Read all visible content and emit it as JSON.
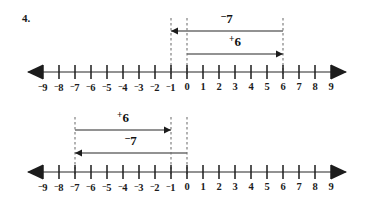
{
  "page": {
    "problem_number": "4.",
    "background_color": "#ffffff",
    "ink_color": "#1c1c1c",
    "line_color": "#6e6e6e",
    "dash_color": "#8a8a8a"
  },
  "axis": {
    "min": -9,
    "max": 9,
    "step": 1,
    "tick_labels": [
      "⁻9",
      "⁻8",
      "⁻7",
      "⁻6",
      "⁻5",
      "⁻4",
      "⁻3",
      "⁻2",
      "⁻1",
      "0",
      "1",
      "2",
      "3",
      "4",
      "5",
      "6",
      "7",
      "8",
      "9"
    ],
    "left_arrowhead": "arrow-left-icon",
    "right_arrowhead": "arrow-right-icon"
  },
  "chart_data": {
    "type": "line",
    "xlabel": "",
    "ylabel": "",
    "xlim": [
      -9,
      9
    ],
    "grid": false,
    "legend": "none",
    "x": [
      -9,
      -8,
      -7,
      -6,
      -5,
      -4,
      -3,
      -2,
      -1,
      0,
      1,
      2,
      3,
      4,
      5,
      6,
      7,
      8,
      9
    ],
    "diagrams": [
      {
        "id": "diagram-1",
        "order": "⁻7 first, then ⁺6",
        "dashed_guides": [
          -1,
          0,
          6
        ],
        "jumps": [
          {
            "id": "jump-1-1",
            "label": "⁻7",
            "label_sign": "⁻",
            "label_value": "7",
            "start": 6,
            "end": -1,
            "direction": "left",
            "row": "upper"
          },
          {
            "id": "jump-1-2",
            "label": "⁺6",
            "label_sign": "⁺",
            "label_value": "6",
            "start": 0,
            "end": 6,
            "direction": "right",
            "row": "lower"
          }
        ]
      },
      {
        "id": "diagram-2",
        "order": "⁺6 first, then ⁻7",
        "dashed_guides": [
          -7,
          -1,
          0
        ],
        "jumps": [
          {
            "id": "jump-2-1",
            "label": "⁺6",
            "label_sign": "⁺",
            "label_value": "6",
            "start": -7,
            "end": -1,
            "direction": "right",
            "row": "upper"
          },
          {
            "id": "jump-2-2",
            "label": "⁻7",
            "label_sign": "⁻",
            "label_value": "7",
            "start": 0,
            "end": -7,
            "direction": "left",
            "row": "lower"
          }
        ]
      }
    ]
  }
}
